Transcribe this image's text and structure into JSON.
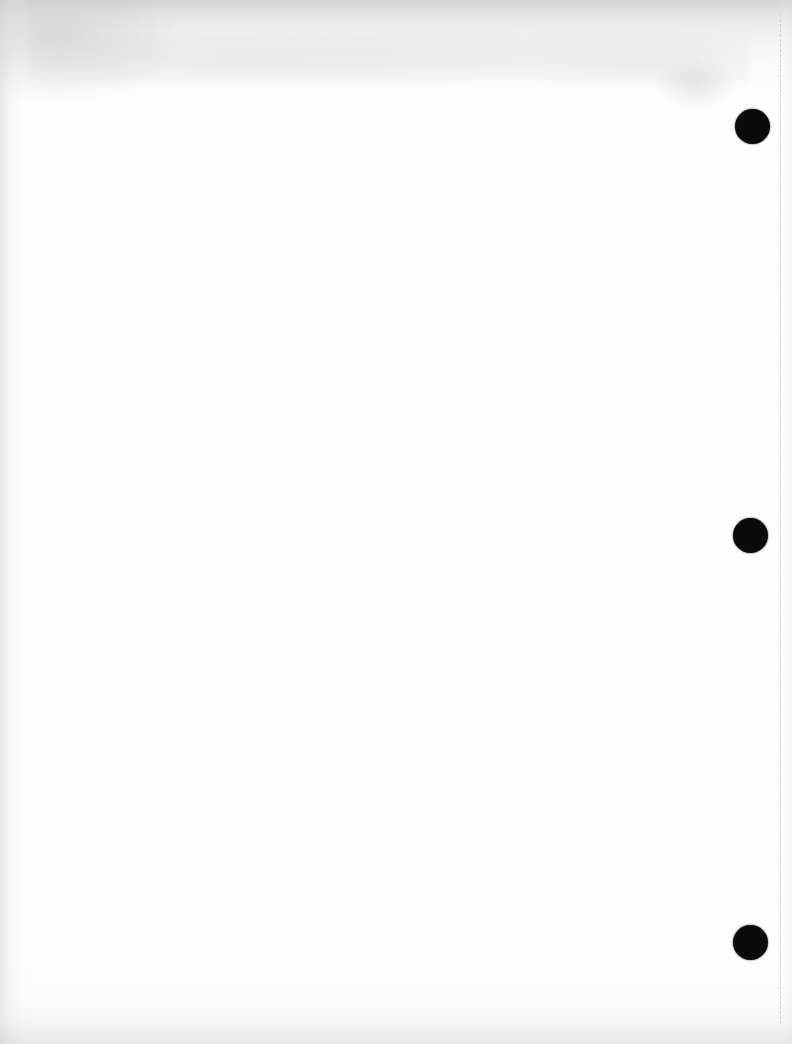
{
  "page": {
    "kind": "scanned-blank-page",
    "label": "Blank scanned document page",
    "width": 792,
    "height": 1044,
    "orientation": "portrait",
    "background_color": "#ffffff",
    "paper_tone_color": "#fefefe",
    "text_content": "",
    "visible_text": "",
    "note_text": ""
  },
  "artifacts": {
    "hole_punches": {
      "label": "Three-ring binder hole punch marks",
      "count": 3,
      "color": "#0a0a0a",
      "diameter": 35,
      "items": [
        {
          "name": "hole-punch-top",
          "cx": 752,
          "cy": 126,
          "d": 35
        },
        {
          "name": "hole-punch-middle",
          "cx": 750,
          "cy": 535,
          "d": 35
        },
        {
          "name": "hole-punch-bottom",
          "cx": 750,
          "cy": 942,
          "d": 35
        }
      ]
    },
    "guide_line": {
      "label": "Faint vertical dashed guide line",
      "color": "#d2d2d4",
      "x": 780,
      "top": 14,
      "bottom": 1024,
      "dash_length": 11,
      "gap_length": 6,
      "thickness": 1
    },
    "scan_shadows": {
      "label": "Scanner edge shadows and smudges",
      "top_color": "#a8a8aa",
      "left_color": "#c6c6ca",
      "bottom_color": "#c4c4c8",
      "right_color": "#e2e2e5",
      "smudge_color": "#cdcdd0"
    }
  }
}
